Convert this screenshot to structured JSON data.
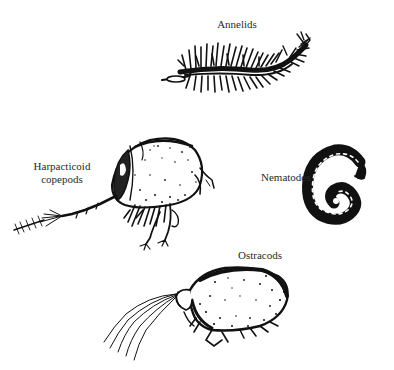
{
  "figure": {
    "background": "#ffffff",
    "ink_color": "#111111",
    "organisms": [
      {
        "id": "annelids",
        "label": "Annelids"
      },
      {
        "id": "harpacticoid",
        "label_lines": [
          "Harpacticoid",
          "copepods"
        ]
      },
      {
        "id": "nematodes",
        "label": "Nematodes"
      },
      {
        "id": "ostracods",
        "label": "Ostracods"
      }
    ]
  }
}
